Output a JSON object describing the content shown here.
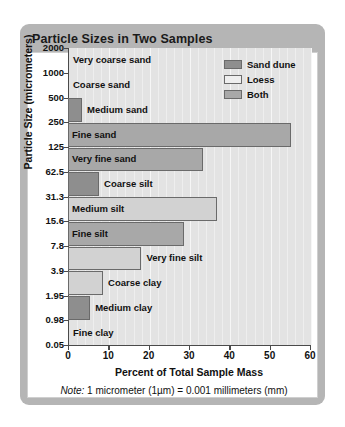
{
  "card": {
    "title": "Particle Sizes in Two Samples"
  },
  "chart_data": {
    "type": "bar",
    "orientation": "horizontal",
    "title": "Particle Sizes in Two Samples",
    "xlabel": "Percent of Total Sample Mass",
    "ylabel": "Particle Size (micrometers)",
    "note": "1 micrometer (1µm) = 0.001 millimeters (mm)",
    "note_prefix": "Note:",
    "xlim": [
      0,
      60
    ],
    "xticks": [
      "0",
      "10",
      "20",
      "30",
      "40",
      "50",
      "60"
    ],
    "xtick_values": [
      0,
      10,
      20,
      30,
      40,
      50,
      60
    ],
    "grid": true,
    "legend_position": "top-right",
    "yticks": [
      "2000",
      "1000",
      "500",
      "250",
      "125",
      "62.5",
      "31.3",
      "15.6",
      "7.8",
      "3.9",
      "1.95",
      "0.98",
      "0.05"
    ],
    "categories": [
      "Very coarse sand",
      "Coarse sand",
      "Medium sand",
      "Fine sand",
      "Very fine sand",
      "Coarse silt",
      "Medium silt",
      "Fine silt",
      "Very fine silt",
      "Coarse clay",
      "Medium clay",
      "Fine clay"
    ],
    "values": [
      0,
      0,
      3.5,
      55.3,
      33.5,
      7.7,
      37.0,
      28.8,
      18.2,
      8.7,
      5.5,
      0
    ],
    "series_of_bar": [
      "none",
      "none",
      "sanddune",
      "both",
      "both",
      "sanddune",
      "loess",
      "both",
      "loess",
      "loess",
      "sanddune",
      "none"
    ],
    "bars": [
      {
        "category": "Very coarse sand",
        "value": 0,
        "series": "none",
        "label_inside": false
      },
      {
        "category": "Coarse sand",
        "value": 0,
        "series": "none",
        "label_inside": false
      },
      {
        "category": "Medium sand",
        "value": 3.5,
        "series": "sanddune",
        "label_inside": false
      },
      {
        "category": "Fine sand",
        "value": 55.3,
        "series": "both",
        "label_inside": true
      },
      {
        "category": "Very fine sand",
        "value": 33.5,
        "series": "both",
        "label_inside": true
      },
      {
        "category": "Coarse silt",
        "value": 7.7,
        "series": "sanddune",
        "label_inside": false
      },
      {
        "category": "Medium silt",
        "value": 37.0,
        "series": "loess",
        "label_inside": true
      },
      {
        "category": "Fine silt",
        "value": 28.8,
        "series": "both",
        "label_inside": true
      },
      {
        "category": "Very fine silt",
        "value": 18.2,
        "series": "loess",
        "label_inside": false
      },
      {
        "category": "Coarse clay",
        "value": 8.7,
        "series": "loess",
        "label_inside": false
      },
      {
        "category": "Medium clay",
        "value": 5.5,
        "series": "sanddune",
        "label_inside": false
      },
      {
        "category": "Fine clay",
        "value": 0,
        "series": "none",
        "label_inside": false
      }
    ],
    "legend": [
      {
        "label": "Sand dune",
        "key": "sanddune",
        "color": "#8e8e8e"
      },
      {
        "label": "Loess",
        "key": "loess",
        "color": "#eeeeee"
      },
      {
        "label": "Both",
        "key": "both",
        "color": "#a8a8a8"
      }
    ],
    "colors": {
      "sand_dune": "#8e8e8e",
      "loess": "#d2d2d2",
      "both": "#a8a8a8",
      "plot_background": "#e3e3e3",
      "card_background": "#b5b5b5"
    }
  }
}
